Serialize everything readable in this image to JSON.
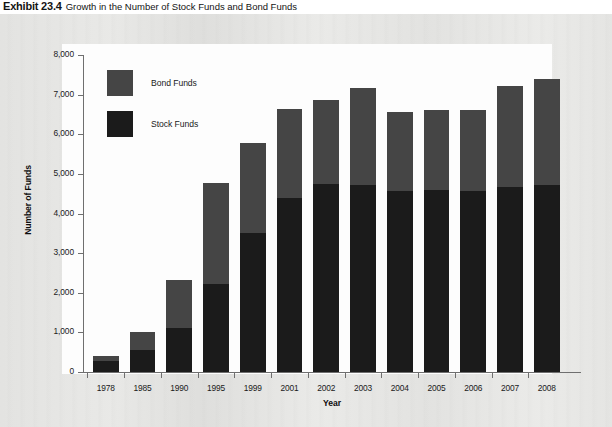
{
  "exhibit": {
    "number": "Exhibit 23.4",
    "title": "Growth in the Number of Stock Funds and Bond Funds"
  },
  "chart_data": {
    "type": "bar",
    "subtype": "stacked-bar",
    "title": "Growth in the Number of Stock Funds and Bond Funds",
    "xlabel": "Year",
    "ylabel": "Number of Funds",
    "ylim": [
      0,
      8000
    ],
    "ytick_step": 1000,
    "ytick_labels": [
      "0",
      "1,000",
      "2,000",
      "3,000",
      "4,000",
      "5,000",
      "6,000",
      "7,000",
      "8,000"
    ],
    "ytick_values": [
      0,
      1000,
      2000,
      3000,
      4000,
      5000,
      6000,
      7000,
      8000
    ],
    "grid": false,
    "legend_position": "upper-left-inside",
    "categories": [
      "1978",
      "1985",
      "1990",
      "1995",
      "1999",
      "2001",
      "2002",
      "2003",
      "2004",
      "2005",
      "2006",
      "2007",
      "2008"
    ],
    "series": [
      {
        "name": "Stock Funds",
        "color": "#1b1b1b",
        "values": [
          280,
          560,
          1100,
          2210,
          3500,
          4400,
          4740,
          4720,
          4570,
          4590,
          4560,
          4670,
          4720
        ]
      },
      {
        "name": "Bond Funds",
        "color": "#454545",
        "values": [
          120,
          460,
          1210,
          2550,
          2290,
          2230,
          2130,
          2450,
          2000,
          2010,
          2060,
          2560,
          2680
        ]
      }
    ],
    "totals": [
      400,
      1020,
      2310,
      4760,
      5790,
      6630,
      6870,
      7170,
      6570,
      6600,
      6620,
      7230,
      7400
    ]
  },
  "colors": {
    "stock": "#1b1b1b",
    "bond": "#454545",
    "axis": "#6f6f6f",
    "text": "#1a1a1a",
    "panel": "#fdfdfd",
    "page": "#e9e9e7"
  }
}
